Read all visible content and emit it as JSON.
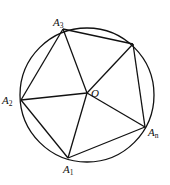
{
  "figure": {
    "type": "inscribed-polygon-in-circle",
    "center_label": "O",
    "vertices": [
      {
        "id": "A1",
        "base": "A",
        "sub": "1"
      },
      {
        "id": "A2",
        "base": "A",
        "sub": "2"
      },
      {
        "id": "A3",
        "base": "A",
        "sub": "3"
      },
      {
        "id": "A4",
        "base": "",
        "sub": ""
      },
      {
        "id": "An",
        "base": "A",
        "sub": "n"
      }
    ],
    "polygon_order": [
      "A1",
      "A2",
      "A3",
      "A4",
      "An"
    ],
    "spokes_from_center": [
      "A1",
      "A2",
      "A3",
      "A4",
      "An"
    ],
    "colors": {
      "stroke": "#111111",
      "background": "#ffffff"
    }
  }
}
